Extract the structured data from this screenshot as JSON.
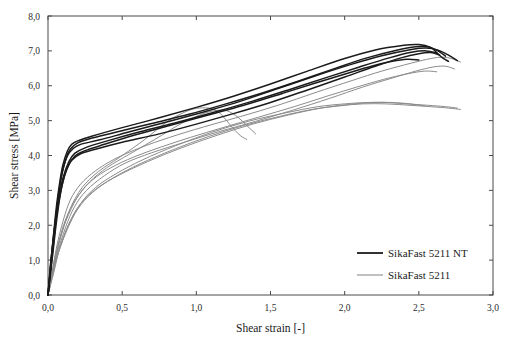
{
  "chart_data": {
    "type": "line",
    "title": "",
    "xlabel": "Shear strain [-]",
    "ylabel": "Shear stress [MPa]",
    "xlim": [
      0.0,
      3.0
    ],
    "ylim": [
      0.0,
      8.0
    ],
    "xticks": [
      "0,0",
      "0,5",
      "1,0",
      "1,5",
      "2,0",
      "2,5",
      "3,0"
    ],
    "xtick_values": [
      0.0,
      0.5,
      1.0,
      1.5,
      2.0,
      2.5,
      3.0
    ],
    "yticks": [
      "0,0",
      "1,0",
      "2,0",
      "3,0",
      "4,0",
      "5,0",
      "6,0",
      "7,0",
      "8,0"
    ],
    "ytick_values": [
      0.0,
      1.0,
      2.0,
      3.0,
      4.0,
      5.0,
      6.0,
      7.0,
      8.0
    ],
    "grid": false,
    "legend_position": "lower-right",
    "legend": [
      {
        "name": "SikaFast 5211 NT",
        "color": "#1b1b1b",
        "width": 1.8
      },
      {
        "name": "SikaFast 5211",
        "color": "#8c8c8c",
        "width": 1.1
      }
    ],
    "series": [
      {
        "name": "SikaFast 5211 NT",
        "color": "#1b1b1b",
        "style": "curve-nt",
        "replicates": [
          {
            "id": "NT-1",
            "x": [
              0.0,
              0.02,
              0.04,
              0.06,
              0.08,
              0.1,
              0.13,
              0.16,
              0.2,
              0.3,
              0.5,
              0.75,
              1.0,
              1.25,
              1.5,
              1.75,
              2.0,
              2.2,
              2.4,
              2.5,
              2.58,
              2.62,
              2.66,
              2.7
            ],
            "y": [
              0.0,
              0.95,
              1.85,
              2.65,
              3.25,
              3.72,
              4.12,
              4.32,
              4.42,
              4.56,
              4.8,
              5.08,
              5.38,
              5.7,
              6.05,
              6.42,
              6.78,
              7.02,
              7.16,
              7.18,
              7.1,
              6.95,
              6.8,
              6.7
            ]
          },
          {
            "id": "NT-2",
            "x": [
              0.0,
              0.02,
              0.04,
              0.06,
              0.08,
              0.1,
              0.13,
              0.17,
              0.22,
              0.35,
              0.55,
              0.8,
              1.05,
              1.3,
              1.55,
              1.8,
              2.05,
              2.25,
              2.45,
              2.55,
              2.63,
              2.7,
              2.76
            ],
            "y": [
              0.0,
              0.88,
              1.72,
              2.5,
              3.12,
              3.58,
              3.98,
              4.2,
              4.32,
              4.45,
              4.68,
              4.96,
              5.25,
              5.56,
              5.92,
              6.28,
              6.62,
              6.86,
              7.04,
              7.08,
              7.02,
              6.88,
              6.72
            ]
          },
          {
            "id": "NT-3",
            "x": [
              0.0,
              0.02,
              0.05,
              0.07,
              0.09,
              0.12,
              0.15,
              0.2,
              0.28,
              0.45,
              0.7,
              0.95,
              1.2,
              1.45,
              1.7,
              1.95,
              2.15,
              2.35,
              2.48,
              2.56,
              2.62,
              2.68
            ],
            "y": [
              0.0,
              1.02,
              2.05,
              2.82,
              3.4,
              3.9,
              4.18,
              4.36,
              4.48,
              4.66,
              4.92,
              5.18,
              5.48,
              5.8,
              6.15,
              6.52,
              6.8,
              7.02,
              7.12,
              7.12,
              7.02,
              6.85
            ]
          },
          {
            "id": "NT-4",
            "x": [
              0.0,
              0.02,
              0.04,
              0.06,
              0.09,
              0.12,
              0.16,
              0.22,
              0.32,
              0.5,
              0.75,
              1.0,
              1.25,
              1.5,
              1.75,
              2.0,
              2.2,
              2.38,
              2.5,
              2.58,
              2.64
            ],
            "y": [
              0.0,
              0.8,
              1.6,
              2.35,
              3.05,
              3.52,
              3.86,
              4.05,
              4.18,
              4.38,
              4.62,
              4.9,
              5.2,
              5.52,
              5.88,
              6.25,
              6.55,
              6.8,
              6.92,
              6.95,
              6.88
            ]
          },
          {
            "id": "NT-5",
            "x": [
              0.0,
              0.02,
              0.04,
              0.07,
              0.1,
              0.14,
              0.18,
              0.25,
              0.4,
              0.62,
              0.88,
              1.12,
              1.38,
              1.62,
              1.88,
              2.1,
              2.3,
              2.45,
              2.55,
              2.62
            ],
            "y": [
              0.0,
              0.92,
              1.8,
              2.68,
              3.34,
              3.82,
              4.06,
              4.22,
              4.42,
              4.68,
              4.96,
              5.24,
              5.56,
              5.88,
              6.24,
              6.54,
              6.8,
              6.96,
              7.0,
              6.94
            ]
          },
          {
            "id": "NT-6",
            "x": [
              0.0,
              0.03,
              0.06,
              0.09,
              0.13,
              0.18,
              0.25,
              0.38,
              0.58,
              0.82,
              1.08,
              1.32,
              1.58,
              1.82,
              2.02,
              2.18,
              2.32,
              2.42,
              2.5
            ],
            "y": [
              0.0,
              1.1,
              2.2,
              3.05,
              3.66,
              3.98,
              4.14,
              4.32,
              4.58,
              4.86,
              5.16,
              5.44,
              5.78,
              6.1,
              6.36,
              6.56,
              6.7,
              6.76,
              6.74
            ]
          }
        ]
      },
      {
        "name": "SikaFast 5211",
        "color": "#8c8c8c",
        "style": "curve-std",
        "replicates": [
          {
            "id": "STD-1",
            "x": [
              0.0,
              0.03,
              0.06,
              0.1,
              0.15,
              0.22,
              0.32,
              0.45,
              0.62,
              0.82,
              1.05,
              1.3,
              1.55,
              1.8,
              2.05,
              2.25,
              2.45,
              2.58,
              2.66,
              2.72,
              2.78
            ],
            "y": [
              0.0,
              0.7,
              1.42,
              2.1,
              2.72,
              3.18,
              3.56,
              3.9,
              4.22,
              4.52,
              4.82,
              5.12,
              5.44,
              5.8,
              6.15,
              6.42,
              6.65,
              6.78,
              6.82,
              6.78,
              6.68
            ]
          },
          {
            "id": "STD-2",
            "x": [
              0.0,
              0.03,
              0.07,
              0.12,
              0.18,
              0.26,
              0.38,
              0.52,
              0.7,
              0.92,
              1.15,
              1.4,
              1.65,
              1.9,
              2.12,
              2.32,
              2.48,
              2.6,
              2.68,
              2.74
            ],
            "y": [
              0.0,
              0.62,
              1.3,
              1.96,
              2.54,
              3.0,
              3.42,
              3.78,
              4.08,
              4.38,
              4.68,
              4.98,
              5.3,
              5.64,
              5.96,
              6.22,
              6.42,
              6.54,
              6.56,
              6.48
            ]
          },
          {
            "id": "STD-3",
            "x": [
              0.0,
              0.04,
              0.08,
              0.14,
              0.21,
              0.3,
              0.42,
              0.58,
              0.76,
              0.96,
              1.18,
              1.42,
              1.66,
              1.88,
              2.08,
              2.26,
              2.42,
              2.54,
              2.62
            ],
            "y": [
              0.0,
              0.8,
              1.62,
              2.32,
              2.88,
              3.3,
              3.64,
              3.96,
              4.24,
              4.52,
              4.8,
              5.1,
              5.4,
              5.7,
              5.96,
              6.18,
              6.34,
              6.42,
              6.4
            ]
          },
          {
            "id": "STD-4-loop",
            "x": [
              0.0,
              0.04,
              0.09,
              0.15,
              0.23,
              0.34,
              0.48,
              0.64,
              0.8,
              0.92,
              1.0,
              1.08,
              1.14,
              1.18,
              1.22,
              1.26,
              1.3,
              1.34
            ],
            "y": [
              0.0,
              0.85,
              1.72,
              2.48,
              3.08,
              3.54,
              3.94,
              4.42,
              4.96,
              5.24,
              5.35,
              5.36,
              5.28,
              5.12,
              4.92,
              4.72,
              4.56,
              4.46
            ]
          },
          {
            "id": "STD-5",
            "x": [
              0.0,
              0.03,
              0.07,
              0.12,
              0.19,
              0.28,
              0.4,
              0.55,
              0.72,
              0.9,
              1.06,
              1.16,
              1.22,
              1.28,
              1.34,
              1.4
            ],
            "y": [
              0.0,
              0.72,
              1.48,
              2.18,
              2.76,
              3.24,
              3.66,
              4.04,
              4.46,
              4.92,
              5.22,
              5.3,
              5.26,
              5.1,
              4.86,
              4.62
            ]
          },
          {
            "id": "STD-6",
            "x": [
              0.0,
              0.04,
              0.08,
              0.14,
              0.22,
              0.32,
              0.46,
              0.64,
              0.86,
              1.1,
              1.35,
              1.6,
              1.82,
              2.0,
              2.15,
              2.28,
              2.42,
              2.56,
              2.68,
              2.76
            ],
            "y": [
              0.0,
              0.66,
              1.36,
              2.02,
              2.62,
              3.08,
              3.48,
              3.88,
              4.28,
              4.66,
              4.98,
              5.22,
              5.4,
              5.48,
              5.52,
              5.52,
              5.48,
              5.44,
              5.4,
              5.36
            ]
          },
          {
            "id": "STD-7",
            "x": [
              0.0,
              0.03,
              0.07,
              0.13,
              0.2,
              0.3,
              0.44,
              0.62,
              0.84,
              1.08,
              1.32,
              1.56,
              1.78,
              1.96,
              2.12,
              2.28,
              2.44,
              2.58,
              2.7,
              2.78
            ],
            "y": [
              0.0,
              0.58,
              1.22,
              1.88,
              2.46,
              2.94,
              3.36,
              3.76,
              4.16,
              4.54,
              4.86,
              5.12,
              5.32,
              5.42,
              5.48,
              5.48,
              5.44,
              5.4,
              5.36,
              5.32
            ]
          },
          {
            "id": "STD-8",
            "x": [
              0.0,
              0.03,
              0.08,
              0.14,
              0.22,
              0.33,
              0.48,
              0.68,
              0.9,
              1.14,
              1.38,
              1.62,
              1.84,
              2.02,
              2.18,
              2.32,
              2.44,
              2.54
            ],
            "y": [
              0.0,
              0.62,
              1.34,
              2.04,
              2.62,
              3.06,
              3.44,
              3.84,
              4.22,
              4.58,
              4.9,
              5.16,
              5.36,
              5.46,
              5.52,
              5.52,
              5.48,
              5.42
            ]
          }
        ]
      }
    ]
  }
}
